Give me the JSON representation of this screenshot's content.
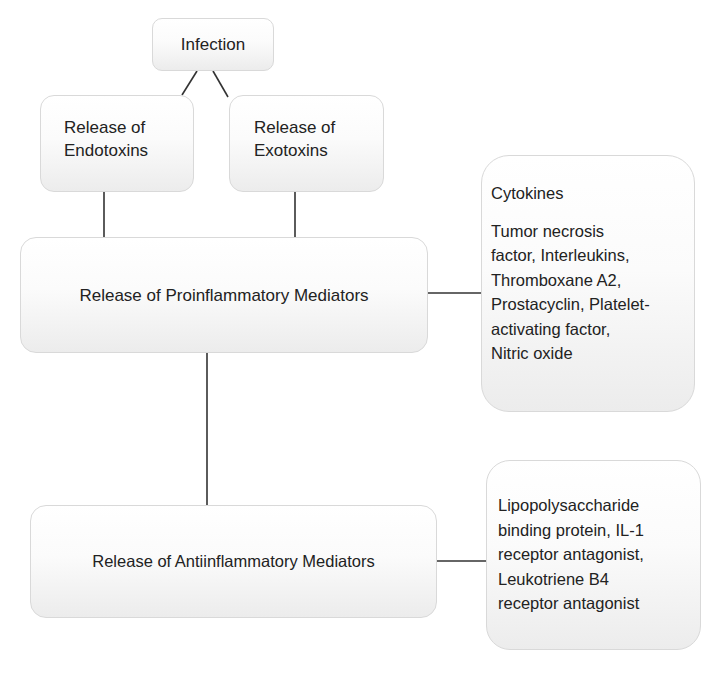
{
  "diagram": {
    "type": "flowchart",
    "nodes": {
      "infection": {
        "label": "Infection"
      },
      "endotoxins": {
        "line1": "Release of",
        "line2": "Endotoxins"
      },
      "exotoxins": {
        "line1": "Release of",
        "line2": "Exotoxins"
      },
      "proinflammatory": {
        "label": "Release of Proinflammatory Mediators"
      },
      "cytokines": {
        "heading": "Cytokines",
        "lines": [
          "Tumor necrosis",
          "factor, Interleukins,",
          "Thromboxane A2,",
          "Prostacyclin, Platelet-",
          "activating factor,",
          "Nitric oxide"
        ]
      },
      "antiinflammatory": {
        "label": "Release of Antiinflammatory Mediators"
      },
      "anti_mediators": {
        "lines": [
          "Lipopolysaccharide",
          "binding protein, IL-1",
          "receptor antagonist,",
          "Leukotriene B4",
          "receptor antagonist"
        ]
      }
    },
    "edges": [
      {
        "from": "infection",
        "to": "endotoxins"
      },
      {
        "from": "infection",
        "to": "exotoxins"
      },
      {
        "from": "endotoxins",
        "to": "proinflammatory"
      },
      {
        "from": "exotoxins",
        "to": "proinflammatory"
      },
      {
        "from": "proinflammatory",
        "to": "cytokines"
      },
      {
        "from": "proinflammatory",
        "to": "antiinflammatory"
      },
      {
        "from": "antiinflammatory",
        "to": "anti_mediators"
      }
    ],
    "colors": {
      "line": "#333333",
      "box_border": "#d9d9d9",
      "box_fill_top": "#ffffff",
      "box_fill_bottom": "#ececec",
      "text": "#222222"
    }
  }
}
